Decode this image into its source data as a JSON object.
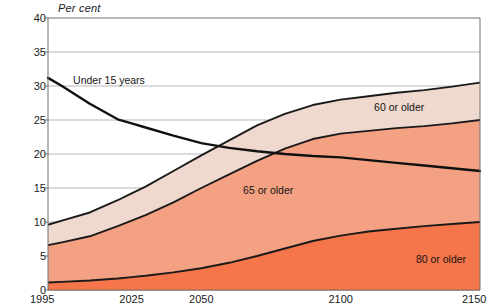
{
  "chart_data": {
    "type": "area",
    "title": "",
    "subtitle": "",
    "xlabel": "",
    "ylabel": "Per cent",
    "ylim": [
      0,
      40
    ],
    "xlim": [
      1995,
      2150
    ],
    "yticks": [
      0,
      5,
      10,
      15,
      20,
      25,
      30,
      35,
      40
    ],
    "xticks": [
      1995,
      2025,
      2050,
      2100,
      2150
    ],
    "xtick_labels": [
      "1995",
      "2025",
      "2050",
      "2100",
      "2150"
    ],
    "ytick_labels": [
      "0",
      "5",
      "10",
      "15",
      "20",
      "25",
      "30",
      "35",
      "40"
    ],
    "grid": "horizontal",
    "legend": "inline-annotations",
    "x": [
      1995,
      2000,
      2010,
      2020,
      2025,
      2030,
      2040,
      2050,
      2060,
      2070,
      2080,
      2090,
      2100,
      2110,
      2120,
      2130,
      2140,
      2150
    ],
    "series": [
      {
        "name": "60 or older",
        "type": "area",
        "color": "#efd9ce",
        "stroke": "#1a1a1a",
        "values": [
          9.6,
          10.2,
          11.4,
          13.2,
          14.2,
          15.2,
          17.5,
          19.8,
          22.0,
          24.2,
          25.9,
          27.2,
          28.0,
          28.5,
          29.0,
          29.4,
          29.9,
          30.5
        ]
      },
      {
        "name": "65 or older",
        "type": "area",
        "color": "#f4a183",
        "stroke": "#1a1a1a",
        "values": [
          6.6,
          7.0,
          7.9,
          9.4,
          10.2,
          11.0,
          12.9,
          15.0,
          17.0,
          19.0,
          20.8,
          22.2,
          23.0,
          23.4,
          23.8,
          24.1,
          24.5,
          25.0
        ]
      },
      {
        "name": "80 or older",
        "type": "area",
        "color": "#f4764a",
        "stroke": "#1a1a1a",
        "values": [
          1.1,
          1.2,
          1.4,
          1.7,
          1.9,
          2.1,
          2.6,
          3.2,
          4.0,
          5.0,
          6.1,
          7.2,
          8.0,
          8.6,
          9.0,
          9.4,
          9.7,
          10.0
        ]
      },
      {
        "name": "Under 15 years",
        "type": "line",
        "color": "none",
        "stroke": "#111111",
        "values": [
          31.2,
          30.0,
          27.4,
          25.1,
          24.5,
          23.9,
          22.7,
          21.6,
          20.9,
          20.4,
          20.0,
          19.7,
          19.5,
          19.1,
          18.7,
          18.3,
          17.9,
          17.5
        ]
      }
    ],
    "annotations": [
      {
        "text": "Under 15 years",
        "x": 2004,
        "y": 30.8
      },
      {
        "text": "60 or older",
        "x": 2112,
        "y": 26.8
      },
      {
        "text": "65 or older",
        "x": 2065,
        "y": 14.6
      },
      {
        "text": "80 or older",
        "x": 2127,
        "y": 4.4
      }
    ],
    "colors": {
      "band_60": "#efd9ce",
      "band_65": "#f4a183",
      "band_80": "#f4764a",
      "line": "#111111",
      "gridline": "#9a9a9a",
      "axis": "#707070",
      "background": "#ffffff"
    }
  }
}
